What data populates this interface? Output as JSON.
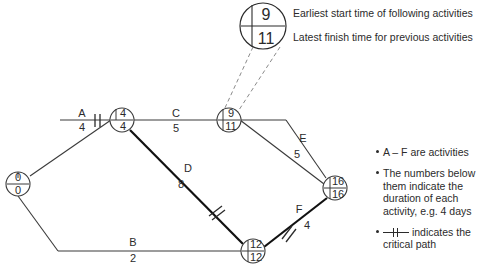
{
  "diagram": {
    "callout": {
      "node": {
        "early": "9",
        "late": "11"
      },
      "line1": "Earliest start time of following activities",
      "line2": "Latest finish time for previous activities"
    },
    "nodes": [
      {
        "id": "start",
        "early": "0",
        "late": "0",
        "cx": 18,
        "cy": 184
      },
      {
        "id": "n2",
        "early": "4",
        "late": "4",
        "cx": 122,
        "cy": 120
      },
      {
        "id": "n3",
        "early": "9",
        "late": "11",
        "cx": 229,
        "cy": 120
      },
      {
        "id": "n4",
        "early": "12",
        "late": "12",
        "cx": 253,
        "cy": 251
      },
      {
        "id": "end",
        "early": "16",
        "late": "16",
        "cx": 335,
        "cy": 188
      }
    ],
    "activities": [
      {
        "id": "A",
        "label": "A",
        "duration": "4",
        "lx": 82,
        "ly": 117,
        "dx": 82,
        "dy": 131,
        "critical": true
      },
      {
        "id": "B",
        "label": "B",
        "duration": "2",
        "lx": 133,
        "ly": 246,
        "dx": 133,
        "dy": 261,
        "critical": false
      },
      {
        "id": "C",
        "label": "C",
        "duration": "5",
        "lx": 176,
        "ly": 117,
        "dx": 176,
        "dy": 131,
        "critical": false
      },
      {
        "id": "D",
        "label": "D",
        "duration": "8",
        "lx": 186,
        "ly": 172,
        "dx": 180,
        "dy": 188,
        "critical": true
      },
      {
        "id": "E",
        "label": "E",
        "duration": "5",
        "lx": 302,
        "ly": 141,
        "dx": 296,
        "dy": 158,
        "critical": false
      },
      {
        "id": "F",
        "label": "F",
        "duration": "4",
        "lx": 301,
        "ly": 212,
        "dx": 308,
        "dy": 228,
        "critical": true
      }
    ],
    "legend": {
      "items": [
        {
          "id": "activities-note",
          "text": "A – F are activities",
          "symbol": "none"
        },
        {
          "id": "duration-note",
          "text": "The numbers below them indicate the duration of each activity, e.g. 4 days",
          "symbol": "none"
        },
        {
          "id": "critical-path-note",
          "text": "indicates the critical path",
          "symbol": "critical-path-mark"
        }
      ]
    },
    "colors": {
      "ink": "#2b2b2b",
      "line": "#3a3a3a",
      "critical": "#111111",
      "dashed": "#8a8a8a",
      "background": "#ffffff"
    }
  }
}
